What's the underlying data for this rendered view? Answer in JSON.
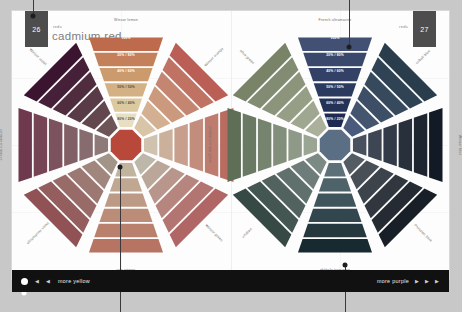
{
  "spread": {
    "section_label_left": "reds",
    "section_label_right": "reds",
    "page_left": "26",
    "page_right": "27",
    "title": "cadmium red"
  },
  "footer": {
    "left_label": "more yellow",
    "right_label": "more purple",
    "prev_icon": "prev-arrow-icon",
    "prev_icon_glyph": "◀",
    "next_icon": "next-arrow-icon",
    "next_icon_glyph": "▶",
    "current_dot": "current-page-dot"
  },
  "chart_data": {
    "type": "pie",
    "legend_position": "around-perimeter",
    "mix_steps": [
      "100%",
      "20% / 80%",
      "40% / 60%",
      "50% / 50%",
      "60% / 40%",
      "80% / 20%"
    ],
    "wheels": [
      {
        "name": "cadmium red wheel",
        "center_color": "#b8493a",
        "center_label": "cadmium red",
        "spokes": [
          {
            "angle": -90,
            "label": "Winsor lemon",
            "label_rot": 0,
            "colors": [
              "#e8dfc2",
              "#ddc9a0",
              "#d3b184",
              "#cb9a6d",
              "#c4805a",
              "#be6a4c"
            ]
          },
          {
            "angle": -45,
            "label": "Winsor orange",
            "label_rot": -45,
            "colors": [
              "#d8c4a6",
              "#d2b091",
              "#cb9a7e",
              "#c58671",
              "#c07263",
              "#bb5e55"
            ]
          },
          {
            "angle": 0,
            "label": "cadmium yellow",
            "label_rot": 90,
            "colors": [
              "#cfc2ae",
              "#cbb19c",
              "#c79f8c",
              "#c28d7c",
              "#bd7c6d",
              "#b96c60"
            ]
          },
          {
            "angle": 45,
            "label": "Winsor green",
            "label_rot": 45,
            "colors": [
              "#bdb7aa",
              "#bba79a",
              "#b9968c",
              "#b6867e",
              "#b37571",
              "#b06665"
            ]
          },
          {
            "angle": 90,
            "label": "raw sienna",
            "label_rot": 0,
            "colors": [
              "#c0b49f",
              "#bfa792",
              "#bd9a85",
              "#bb8d79",
              "#b9806d",
              "#b77462"
            ]
          },
          {
            "angle": 135,
            "label": "ultramarine violet",
            "label_rot": -45,
            "colors": [
              "#a39488",
              "#a0867d",
              "#9c7872",
              "#986b68",
              "#945e5e",
              "#905254"
            ]
          },
          {
            "angle": 180,
            "label": "permanent mauve",
            "label_rot": 90,
            "colors": [
              "#8d7a78",
              "#876c6f",
              "#815f66",
              "#7b525e",
              "#754555",
              "#6f394d"
            ]
          },
          {
            "angle": -135,
            "label": "Winsor violet",
            "label_rot": 45,
            "colors": [
              "#6d5557",
              "#63474f",
              "#593a47",
              "#4f2d3f",
              "#452038",
              "#3b1430"
            ]
          }
        ]
      },
      {
        "name": "French ultramarine wheel",
        "center_color": "#5b6f84",
        "center_label": "French ultramarine",
        "spokes": [
          {
            "angle": -90,
            "label": "French ultramarine",
            "label_rot": 0,
            "colors": [
              "#1d2b52",
              "#243258",
              "#2b3a5f",
              "#334166",
              "#3a486c",
              "#425073"
            ]
          },
          {
            "angle": -45,
            "label": "cobalt blue",
            "label_rot": -45,
            "colors": [
              "#4a5a7c",
              "#43556f",
              "#3d4f66",
              "#36495d",
              "#304355",
              "#2a3d4c"
            ]
          },
          {
            "angle": 0,
            "label": "Winsor blue",
            "label_rot": 90,
            "colors": [
              "#49515f",
              "#3e4653",
              "#333b48",
              "#28303c",
              "#1d2531",
              "#121a26"
            ]
          },
          {
            "angle": 45,
            "label": "Prussian blue",
            "label_rot": 45,
            "colors": [
              "#545c63",
              "#484f57",
              "#3c434b",
              "#30373f",
              "#242b33",
              "#181f27"
            ]
          },
          {
            "angle": 90,
            "label": "phthalo turquoise",
            "label_rot": 0,
            "colors": [
              "#5d7078",
              "#4e6269",
              "#40545b",
              "#32464d",
              "#24383e",
              "#162a30"
            ]
          },
          {
            "angle": 135,
            "label": "viridian",
            "label_rot": -45,
            "colors": [
              "#7c8a86",
              "#6e7d79",
              "#60706c",
              "#52635f",
              "#445652",
              "#364945"
            ]
          },
          {
            "angle": 180,
            "label": "permanent sap green",
            "label_rot": 90,
            "colors": [
              "#9aa593",
              "#8e9a87",
              "#828f7b",
              "#76846f",
              "#6a7963",
              "#5e6e57"
            ]
          },
          {
            "angle": -135,
            "label": "olive green",
            "label_rot": 45,
            "colors": [
              "#aab09a",
              "#a0a790",
              "#969e86",
              "#8c957c",
              "#828c72",
              "#788368"
            ]
          }
        ]
      }
    ]
  }
}
